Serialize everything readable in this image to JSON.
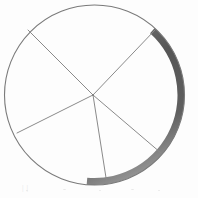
{
  "figure": {
    "background_color": "#fdfdfd",
    "ink_color": "#7a7a7a",
    "shadow_color": "#4f4f4f",
    "circle": {
      "center_x": 94.5,
      "center_y": 95,
      "radius": 90,
      "outline_width": 1.1,
      "label": "circle outline"
    },
    "shaded_rim": {
      "label": "shaded crescent rim",
      "start_angle_deg": -48,
      "end_angle_deg": 95,
      "max_thickness": 7,
      "color": "#4f4f4f"
    },
    "center_point": {
      "label": "center vertex",
      "x": 93,
      "y": 95
    },
    "radii": [
      {
        "name": "radius-upper-left",
        "angle_deg": 212,
        "end_x": 28,
        "end_y": 30
      },
      {
        "name": "radius-upper-right",
        "angle_deg": 317,
        "end_x": 155,
        "end_y": 30
      },
      {
        "name": "radius-lower-right",
        "angle_deg": 41,
        "end_x": 161,
        "end_y": 153
      },
      {
        "name": "radius-bottom",
        "angle_deg": 81,
        "end_x": 107,
        "end_y": 184
      },
      {
        "name": "radius-lower-left",
        "angle_deg": 153,
        "end_x": 17,
        "end_y": 133
      }
    ],
    "sectors": [
      {
        "name": "sector-top",
        "from_deg": 212,
        "to_deg": 317
      },
      {
        "name": "sector-right",
        "from_deg": 317,
        "to_deg": 401
      },
      {
        "name": "sector-bottom-right",
        "from_deg": 41,
        "to_deg": 81
      },
      {
        "name": "sector-bottom-left",
        "from_deg": 81,
        "to_deg": 153
      },
      {
        "name": "sector-left",
        "from_deg": 153,
        "to_deg": 212
      }
    ]
  },
  "caption": {
    "text": "|     |",
    "visible": true
  }
}
